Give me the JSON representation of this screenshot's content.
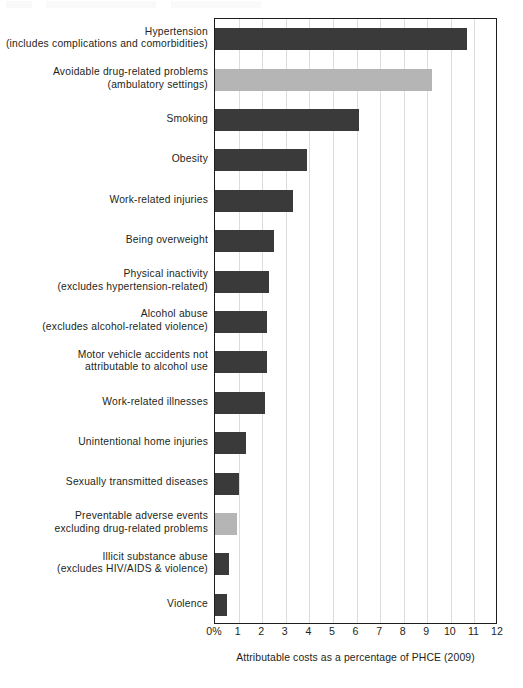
{
  "chart_data": {
    "type": "bar",
    "orientation": "horizontal",
    "title": "",
    "xlabel": "Attributable costs as a percentage of PHCE (2009)",
    "ylabel": "",
    "xlim": [
      0,
      12
    ],
    "xticks": [
      "0%",
      "1",
      "2",
      "3",
      "4",
      "5",
      "6",
      "7",
      "8",
      "9",
      "10",
      "11",
      "12"
    ],
    "grid": true,
    "legend": "none",
    "categories": [
      "Hypertension\n(includes complications and comorbidities)",
      "Avoidable drug-related problems\n(ambulatory settings)",
      "Smoking",
      "Obesity",
      "Work-related injuries",
      "Being overweight",
      "Physical inactivity\n(excludes hypertension-related)",
      "Alcohol abuse\n(excludes alcohol-related violence)",
      "Motor vehicle accidents not\nattributable to alcohol use",
      "Work-related illnesses",
      "Unintentional home injuries",
      "Sexually transmitted diseases",
      "Preventable adverse events\nexcluding drug-related problems",
      "Illicit substance abuse\n(excludes HIV/AIDS & violence)",
      "Violence"
    ],
    "values": [
      10.7,
      9.2,
      6.1,
      3.9,
      3.3,
      2.5,
      2.3,
      2.2,
      2.2,
      2.1,
      1.3,
      1.0,
      0.95,
      0.6,
      0.5
    ],
    "bar_colors": [
      "#3a3a3a",
      "#b5b5b5",
      "#3a3a3a",
      "#3a3a3a",
      "#3a3a3a",
      "#3a3a3a",
      "#3a3a3a",
      "#3a3a3a",
      "#3a3a3a",
      "#3a3a3a",
      "#3a3a3a",
      "#3a3a3a",
      "#b5b5b5",
      "#3a3a3a",
      "#3a3a3a"
    ],
    "colors": {
      "primary_bar": "#3a3a3a",
      "highlight_bar": "#b5b5b5",
      "gridline": "#dcdcdc",
      "axis": "#1d1d1d",
      "text": "#231f20",
      "background": "#ffffff"
    }
  }
}
